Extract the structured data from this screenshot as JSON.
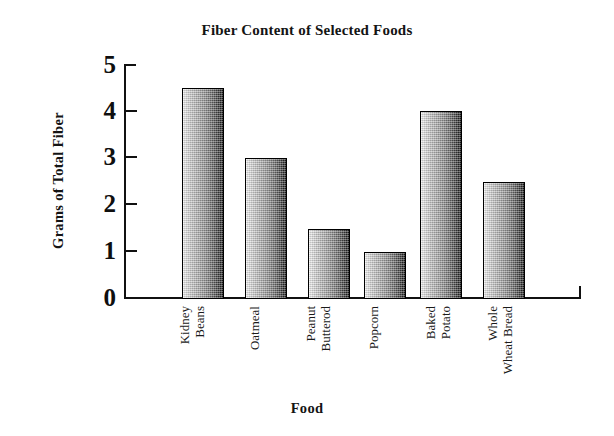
{
  "chart_data": {
    "type": "bar",
    "title": "Fiber Content of Selected Foods",
    "xlabel": "Food",
    "ylabel": "Grams of Total Fiber",
    "categories": [
      "Kidney Beans",
      "Oatmeal",
      "Peanut Butterod",
      "Popcorn",
      "Baked Potato",
      "Whole Wheat Bread"
    ],
    "category_lines": [
      [
        "Kidney",
        "Beans"
      ],
      [
        "Oatmeal"
      ],
      [
        "Peanut",
        "Butterod"
      ],
      [
        "Popcorn"
      ],
      [
        "Baked",
        "Potato"
      ],
      [
        "Whole",
        "Wheat Bread"
      ]
    ],
    "values": [
      4.5,
      3.0,
      1.5,
      1.0,
      4.0,
      2.5
    ],
    "ylim": [
      0,
      5
    ],
    "yticks": [
      0,
      1,
      2,
      3,
      4,
      5
    ],
    "ytick_labels": [
      "0",
      "1",
      "2",
      "3",
      "4",
      "5"
    ],
    "grid": false,
    "legend": false,
    "bar_fill": "gradient-light-to-dark-gray",
    "bar_edge_color": "#000000",
    "background_color": "#ffffff",
    "text_color": "#1a1a1a"
  },
  "axis": {
    "y_tick_0": "0",
    "y_tick_1": "1",
    "y_tick_2": "2",
    "y_tick_3": "3",
    "y_tick_4": "4",
    "y_tick_5": "5"
  },
  "labels": {
    "kidney_1": "Kidney",
    "kidney_2": "Beans",
    "oatmeal_1": "Oatmeal",
    "peanut_1": "Peanut",
    "peanut_2": "Butterod",
    "popcorn_1": "Popcorn",
    "potato_1": "Baked",
    "potato_2": "Potato",
    "bread_1": "Whole",
    "bread_2": "Wheat Bread"
  }
}
